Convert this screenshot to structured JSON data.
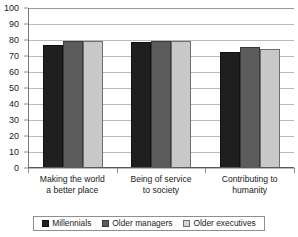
{
  "chart_data": {
    "type": "bar",
    "title": "",
    "xlabel": "",
    "ylabel": "",
    "ylim": [
      0,
      100
    ],
    "ytick_step": 10,
    "yticks": [
      100,
      90,
      80,
      70,
      60,
      50,
      40,
      30,
      20,
      10,
      0
    ],
    "grid": true,
    "legend_position": "bottom",
    "categories": [
      "Making the world a better place",
      "Being of service to society",
      "Contributing to humanity"
    ],
    "category_lines": [
      [
        "Making the world",
        "a better place"
      ],
      [
        "Being of service",
        "to society"
      ],
      [
        "Contributing to",
        "humanity"
      ]
    ],
    "series": [
      {
        "name": "Millennials",
        "color": "#1f1f1f",
        "values": [
          76,
          78,
          72
        ]
      },
      {
        "name": "Older managers",
        "color": "#5c5c5c",
        "values": [
          79,
          79,
          75
        ]
      },
      {
        "name": "Older executives",
        "color": "#c8c8c8",
        "values": [
          79,
          79,
          74
        ]
      }
    ]
  },
  "legend": {
    "items": [
      {
        "label": "Millennials"
      },
      {
        "label": "Older managers"
      },
      {
        "label": "Older executives"
      }
    ]
  },
  "axis": {
    "y_labels": [
      "100",
      "90",
      "80",
      "70",
      "60",
      "50",
      "40",
      "30",
      "20",
      "10",
      "0"
    ]
  }
}
